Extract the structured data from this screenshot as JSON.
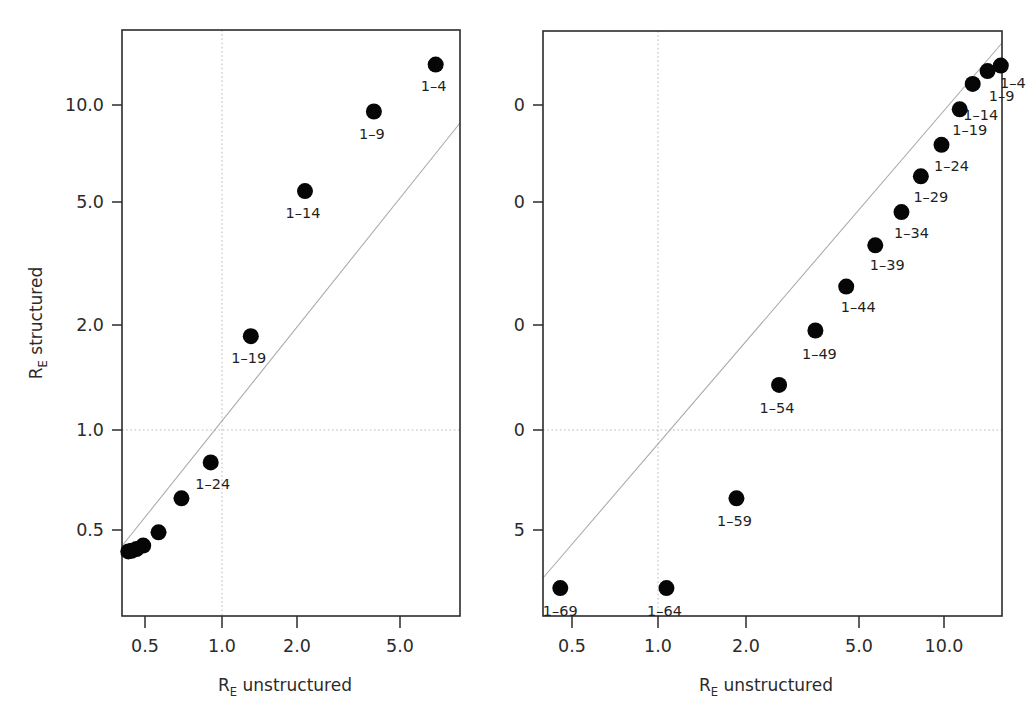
{
  "figure": {
    "axis_labels": {
      "x_main": "R",
      "x_sub": "E",
      "x_rest": " unstructured",
      "y_main": "R",
      "y_sub": "E",
      "y_rest": " structured"
    },
    "marker_color": "#060606",
    "refline_color": "#a9a9a9",
    "grid_color": "#b9b9b9",
    "frame_color": "#2b2b2b"
  },
  "chart_data": [
    {
      "type": "scatter",
      "panel": "left",
      "title": "",
      "xlabel": "R_E unstructured",
      "ylabel": "R_E structured",
      "xscale": "log",
      "yscale": "log",
      "xlim": [
        0.4,
        8.6
      ],
      "ylim": [
        0.285,
        17.5
      ],
      "xticks": [
        0.5,
        1.0,
        2.0,
        5.0
      ],
      "xticklabels": [
        "0.5",
        "1.0",
        "2.0",
        "5.0"
      ],
      "yticks": [
        0.5,
        1.0,
        2.0,
        5.0,
        10.0
      ],
      "yticklabels": [
        "0.5",
        "1.0",
        "2.0",
        "5.0",
        "10.0"
      ],
      "grid": true,
      "gridlines_x": [
        1.0
      ],
      "gridlines_y": [
        1.0
      ],
      "reference_line": {
        "type": "identity",
        "label": "y = x"
      },
      "points": [
        {
          "label": "1-4",
          "x": 6.9,
          "y": 13.3,
          "label_dx": -2,
          "label_dy": 26
        },
        {
          "label": "1-9",
          "x": 3.95,
          "y": 9.55,
          "label_dx": -2,
          "label_dy": 27
        },
        {
          "label": "1-14",
          "x": 2.12,
          "y": 5.45,
          "label_dx": -2,
          "label_dy": 27
        },
        {
          "label": "1-19",
          "x": 1.3,
          "y": 1.96,
          "label_dx": -2,
          "label_dy": 27
        },
        {
          "label": "1-24",
          "x": 0.905,
          "y": 0.805,
          "label_dx": 2,
          "label_dy": 27
        },
        {
          "label": "",
          "x": 0.695,
          "y": 0.625,
          "label_dx": 0,
          "label_dy": 0
        },
        {
          "label": "",
          "x": 0.565,
          "y": 0.492,
          "label_dx": 0,
          "label_dy": 0
        },
        {
          "label": "",
          "x": 0.492,
          "y": 0.448,
          "label_dx": 0,
          "label_dy": 0
        },
        {
          "label": "",
          "x": 0.463,
          "y": 0.437,
          "label_dx": 0,
          "label_dy": 0
        },
        {
          "label": "",
          "x": 0.443,
          "y": 0.432,
          "label_dx": 0,
          "label_dy": 0
        },
        {
          "label": "",
          "x": 0.43,
          "y": 0.43,
          "label_dx": 0,
          "label_dy": 0
        }
      ]
    },
    {
      "type": "scatter",
      "panel": "right",
      "title": "",
      "xlabel": "R_E unstructured",
      "ylabel": "R_E structured",
      "xscale": "log",
      "yscale": "log",
      "xlim": [
        0.4,
        19.5
      ],
      "ylim": [
        0.285,
        17.5
      ],
      "xticks": [
        0.5,
        1.0,
        2.0,
        5.0,
        10.0
      ],
      "xticklabels": [
        "0.5",
        "1.0",
        "2.0",
        "5.0",
        "10.0"
      ],
      "yticks": [
        0.5,
        1.0,
        2.0,
        5.0,
        10.0
      ],
      "yticklabels": [
        "0.5",
        "1.0",
        "2.0",
        "5.0",
        "10.0"
      ],
      "grid": true,
      "gridlines_x": [
        1.0
      ],
      "gridlines_y": [
        1.0
      ],
      "reference_line": {
        "type": "identity",
        "label": "y = x"
      },
      "points": [
        {
          "label": "1-4",
          "x": 15.8,
          "y": 13.2,
          "label_dx": 12,
          "label_dy": 22
        },
        {
          "label": "1-9",
          "x": 14.2,
          "y": 12.7,
          "label_dx": 14,
          "label_dy": 30
        },
        {
          "label": "1-14",
          "x": 12.6,
          "y": 11.6,
          "label_dx": 8,
          "label_dy": 36
        },
        {
          "label": "1-19",
          "x": 11.35,
          "y": 9.7,
          "label_dx": 10,
          "label_dy": 26
        },
        {
          "label": "1-24",
          "x": 9.8,
          "y": 7.55,
          "label_dx": 10,
          "label_dy": 26
        },
        {
          "label": "1-29",
          "x": 8.3,
          "y": 6.05,
          "label_dx": 10,
          "label_dy": 26
        },
        {
          "label": "1-34",
          "x": 7.1,
          "y": 4.7,
          "label_dx": 10,
          "label_dy": 26
        },
        {
          "label": "1-39",
          "x": 5.75,
          "y": 3.72,
          "label_dx": 12,
          "label_dy": 25
        },
        {
          "label": "1-44",
          "x": 4.55,
          "y": 2.78,
          "label_dx": 12,
          "label_dy": 25
        },
        {
          "label": "1-49",
          "x": 3.55,
          "y": 2.04,
          "label_dx": 4,
          "label_dy": 28
        },
        {
          "label": "1-54",
          "x": 2.65,
          "y": 1.39,
          "label_dx": -2,
          "label_dy": 28
        },
        {
          "label": "1-59",
          "x": 1.88,
          "y": 0.625,
          "label_dx": -2,
          "label_dy": 28
        },
        {
          "label": "1-64",
          "x": 1.07,
          "y": 0.332,
          "label_dx": -2,
          "label_dy": 28
        },
        {
          "label": "1-69",
          "x": 0.455,
          "y": 0.332,
          "label_dx": 0,
          "label_dy": 28
        }
      ]
    }
  ]
}
